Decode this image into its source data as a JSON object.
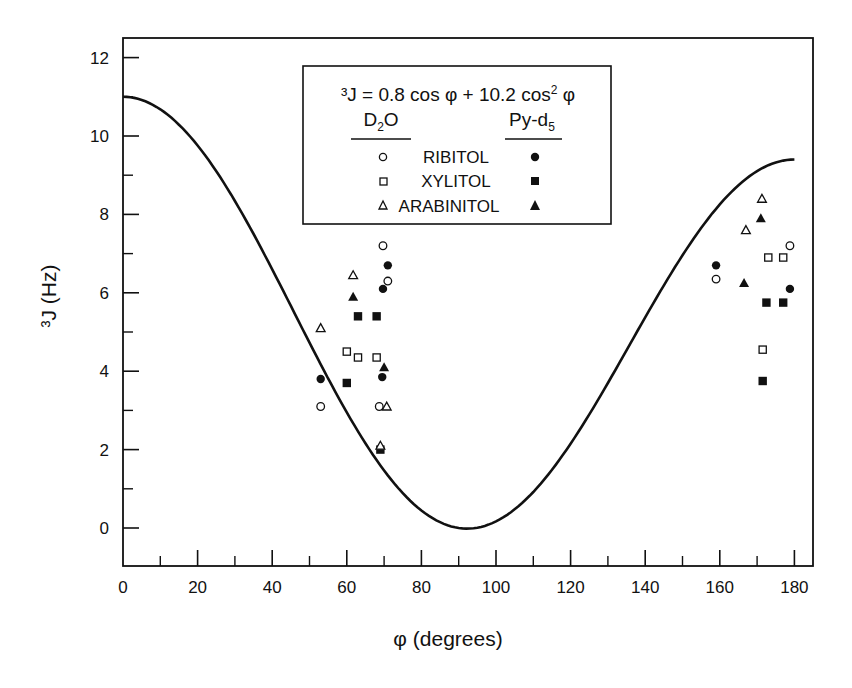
{
  "chart_data": {
    "type": "scatter",
    "title": "",
    "xlabel": "φ (degrees)",
    "ylabel": "³J (Hz)",
    "xlim": [
      0,
      185
    ],
    "ylim": [
      -1,
      12.5
    ],
    "x_ticks": [
      0,
      20,
      40,
      60,
      80,
      100,
      120,
      140,
      160,
      180
    ],
    "x_minor_ticks": [
      10,
      30,
      50,
      70,
      90,
      110,
      130,
      150,
      170
    ],
    "y_ticks": [
      0,
      2,
      4,
      6,
      8,
      10,
      12
    ],
    "y_minor_ticks": [
      1,
      3,
      5,
      7,
      9,
      11
    ],
    "grid": false,
    "legend_position": "upper center (boxed)",
    "curve": {
      "name": "Karplus fit",
      "equation": "³J = 0.8 cos φ + 10.2 cos² φ",
      "a": 0.8,
      "b": 10.2,
      "x_range": [
        0,
        180
      ]
    },
    "legend": {
      "equation_prefix": "³J = 0.8 cos φ + 10.2 cos",
      "equation_sup": "2",
      "equation_suffix": " φ",
      "col_left_main": "D",
      "col_left_sub": "2",
      "col_left_tail": "O",
      "col_right_main": "Py-d",
      "col_right_sub": "5",
      "rows": [
        {
          "label": "RIBITOL",
          "shape": "circle"
        },
        {
          "label": "XYLITOL",
          "shape": "square"
        },
        {
          "label": "ARABINITOL",
          "shape": "triangle"
        }
      ]
    },
    "series": [
      {
        "name": "RIBITOL (D2O)",
        "solvent": "D2O",
        "shape": "circle",
        "filled": false,
        "points": [
          [
            53,
            3.1
          ],
          [
            68.7,
            3.1
          ],
          [
            69.7,
            7.2
          ],
          [
            71,
            6.3
          ],
          [
            159,
            6.35
          ],
          [
            178.8,
            7.2
          ]
        ]
      },
      {
        "name": "RIBITOL (Py-d5)",
        "solvent": "Py-d5",
        "shape": "circle",
        "filled": true,
        "points": [
          [
            53,
            3.8
          ],
          [
            69.5,
            3.85
          ],
          [
            69.7,
            6.1
          ],
          [
            71,
            6.7
          ],
          [
            159,
            6.7
          ],
          [
            178.8,
            6.1
          ]
        ]
      },
      {
        "name": "XYLITOL (D2O)",
        "solvent": "D2O",
        "shape": "square",
        "filled": false,
        "points": [
          [
            60,
            4.5
          ],
          [
            63,
            4.35
          ],
          [
            68,
            4.35
          ],
          [
            171.5,
            4.55
          ],
          [
            173,
            6.9
          ],
          [
            177,
            6.9
          ]
        ]
      },
      {
        "name": "XYLITOL (Py-d5)",
        "solvent": "Py-d5",
        "shape": "square",
        "filled": true,
        "points": [
          [
            60,
            3.7
          ],
          [
            63,
            5.4
          ],
          [
            68,
            5.4
          ],
          [
            69,
            2.0
          ],
          [
            171.5,
            3.75
          ],
          [
            172.5,
            5.75
          ],
          [
            177,
            5.75
          ]
        ]
      },
      {
        "name": "ARABINITOL (D2O)",
        "solvent": "D2O",
        "shape": "triangle",
        "filled": false,
        "points": [
          [
            53,
            5.1
          ],
          [
            61.7,
            6.45
          ],
          [
            69,
            2.1
          ],
          [
            70.7,
            3.1
          ],
          [
            167,
            7.6
          ],
          [
            171.3,
            8.4
          ]
        ]
      },
      {
        "name": "ARABINITOL (Py-d5)",
        "solvent": "Py-d5",
        "shape": "triangle",
        "filled": true,
        "points": [
          [
            61.7,
            5.9
          ],
          [
            70,
            4.1
          ],
          [
            166.5,
            6.25
          ],
          [
            171,
            7.9
          ]
        ]
      }
    ]
  }
}
